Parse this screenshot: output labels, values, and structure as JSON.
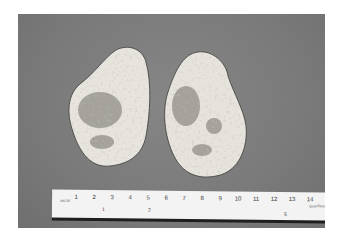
{
  "image": {
    "description": "Photograph of two pale, irregularly shaped tissue specimens with darker mottled areas, lying on a gray background above a centimeter ruler",
    "background_color": "#7b7b7b",
    "specimen_color": "#e6e3dc",
    "mottling_color": "#8a8a82"
  },
  "ruler": {
    "cm_labels": [
      "1",
      "2",
      "3",
      "4",
      "5",
      "6",
      "7",
      "8",
      "9",
      "10",
      "11",
      "12",
      "13",
      "14"
    ],
    "inch_labels": [
      "1",
      "2",
      "",
      "5"
    ],
    "brand_text": "QuanTech",
    "logo_text": "ABCDE"
  }
}
